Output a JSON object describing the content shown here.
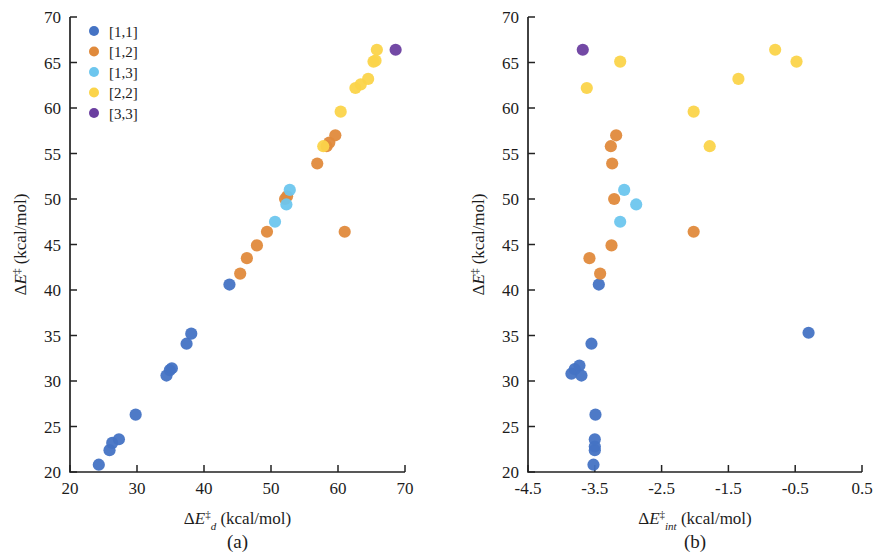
{
  "figure": {
    "background": "#ffffff",
    "panel_a_label": "(a)",
    "panel_b_label": "(b)"
  },
  "legend": {
    "position": "upper-left of panel (a)",
    "entries": [
      {
        "label": "[1,1]",
        "color": "#4573c4"
      },
      {
        "label": "[1,2]",
        "color": "#e08a3c"
      },
      {
        "label": "[1,3]",
        "color": "#6dc6ee"
      },
      {
        "label": "[2,2]",
        "color": "#fbd44a"
      },
      {
        "label": "[3,3]",
        "color": "#6b3fa0"
      }
    ]
  },
  "chart_data": [
    {
      "type": "scatter",
      "panel": "(a)",
      "title": "",
      "xlabel": "ΔE‡d (kcal/mol)",
      "xlabel_parts": {
        "delta": "Δ",
        "var": "E",
        "sup": "‡",
        "sub": "d",
        "unit": " (kcal/mol)"
      },
      "ylabel": "ΔE‡ (kcal/mol)",
      "ylabel_parts": {
        "delta": "Δ",
        "var": "E",
        "sup": "‡",
        "sub": "",
        "unit": " (kcal/mol)"
      },
      "xlim": [
        20,
        70
      ],
      "ylim": [
        20,
        70
      ],
      "xticks": [
        20,
        30,
        40,
        50,
        60,
        70
      ],
      "yticks": [
        20,
        25,
        30,
        35,
        40,
        45,
        50,
        55,
        60,
        65,
        70
      ],
      "grid": false,
      "series": [
        {
          "name": "[1,1]",
          "color": "#4573c4",
          "points": [
            [
              24.3,
              20.8
            ],
            [
              25.9,
              22.4
            ],
            [
              26.3,
              23.2
            ],
            [
              27.3,
              23.6
            ],
            [
              29.8,
              26.3
            ],
            [
              34.4,
              30.6
            ],
            [
              34.9,
              31.2
            ],
            [
              35.2,
              31.4
            ],
            [
              37.4,
              34.1
            ],
            [
              38.1,
              35.2
            ],
            [
              43.8,
              40.6
            ]
          ]
        },
        {
          "name": "[1,2]",
          "color": "#e08a3c",
          "points": [
            [
              45.4,
              41.8
            ],
            [
              46.4,
              43.5
            ],
            [
              47.9,
              44.9
            ],
            [
              49.4,
              46.4
            ],
            [
              52.1,
              50.0
            ],
            [
              52.4,
              50.3
            ],
            [
              56.9,
              53.9
            ],
            [
              58.3,
              55.8
            ],
            [
              58.7,
              56.2
            ],
            [
              59.6,
              57.0
            ],
            [
              61.0,
              46.4
            ]
          ]
        },
        {
          "name": "[1,3]",
          "color": "#6dc6ee",
          "points": [
            [
              50.6,
              47.5
            ],
            [
              52.3,
              49.4
            ],
            [
              52.8,
              51.0
            ]
          ]
        },
        {
          "name": "[2,2]",
          "color": "#fbd44a",
          "points": [
            [
              57.8,
              55.8
            ],
            [
              60.4,
              59.6
            ],
            [
              62.6,
              62.2
            ],
            [
              63.4,
              62.6
            ],
            [
              64.5,
              63.2
            ],
            [
              65.3,
              65.1
            ],
            [
              65.6,
              65.2
            ],
            [
              65.8,
              66.4
            ]
          ]
        },
        {
          "name": "[3,3]",
          "color": "#6b3fa0",
          "points": [
            [
              68.6,
              66.4
            ]
          ]
        }
      ]
    },
    {
      "type": "scatter",
      "panel": "(b)",
      "title": "",
      "xlabel": "ΔE‡int (kcal/mol)",
      "xlabel_parts": {
        "delta": "Δ",
        "var": "E",
        "sup": "‡",
        "sub": "int",
        "unit": " (kcal/mol)"
      },
      "ylabel": "ΔE‡ (kcal/mol)",
      "ylabel_parts": {
        "delta": "Δ",
        "var": "E",
        "sup": "‡",
        "sub": "",
        "unit": " (kcal/mol)"
      },
      "xlim": [
        -4.5,
        0.5
      ],
      "ylim": [
        20,
        70
      ],
      "xticks": [
        -4.5,
        -3.5,
        -2.5,
        -1.5,
        -0.5,
        0.5
      ],
      "yticks": [
        20,
        25,
        30,
        35,
        40,
        45,
        50,
        55,
        60,
        65,
        70
      ],
      "grid": false,
      "series": [
        {
          "name": "[1,1]",
          "color": "#4573c4",
          "points": [
            [
              -3.52,
              20.8
            ],
            [
              -3.5,
              22.4
            ],
            [
              -3.5,
              22.8
            ],
            [
              -3.5,
              23.6
            ],
            [
              -3.49,
              26.3
            ],
            [
              -3.85,
              30.8
            ],
            [
              -3.8,
              31.3
            ],
            [
              -3.73,
              31.7
            ],
            [
              -3.7,
              30.6
            ],
            [
              -3.55,
              34.1
            ],
            [
              -3.44,
              40.6
            ],
            [
              -0.3,
              35.3
            ]
          ]
        },
        {
          "name": "[1,2]",
          "color": "#e08a3c",
          "points": [
            [
              -3.42,
              41.8
            ],
            [
              -3.58,
              43.5
            ],
            [
              -3.25,
              44.9
            ],
            [
              -3.21,
              50.0
            ],
            [
              -3.24,
              53.9
            ],
            [
              -3.26,
              55.8
            ],
            [
              -3.18,
              57.0
            ],
            [
              -2.02,
              46.4
            ]
          ]
        },
        {
          "name": "[1,3]",
          "color": "#6dc6ee",
          "points": [
            [
              -3.12,
              47.5
            ],
            [
              -3.06,
              51.0
            ],
            [
              -2.88,
              49.4
            ]
          ]
        },
        {
          "name": "[2,2]",
          "color": "#fbd44a",
          "points": [
            [
              -3.62,
              62.2
            ],
            [
              -3.12,
              65.1
            ],
            [
              -2.02,
              59.6
            ],
            [
              -1.78,
              55.8
            ],
            [
              -1.35,
              63.2
            ],
            [
              -0.8,
              66.4
            ],
            [
              -0.48,
              65.1
            ]
          ]
        },
        {
          "name": "[3,3]",
          "color": "#6b3fa0",
          "points": [
            [
              -3.68,
              66.4
            ]
          ]
        }
      ]
    }
  ]
}
